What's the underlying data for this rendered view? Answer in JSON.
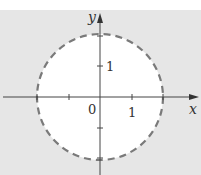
{
  "diagram": {
    "axes": {
      "x_label": "x",
      "y_label": "y",
      "origin_label": "0"
    },
    "ticks": {
      "x_label": "1",
      "y_label": "1"
    },
    "circle": {
      "radius_units": 2,
      "style": "dashed"
    },
    "colors": {
      "shaded": "#e6e6e6",
      "interior": "#ffffff",
      "boundary": "#7a7a7a",
      "axis": "#444444"
    }
  }
}
